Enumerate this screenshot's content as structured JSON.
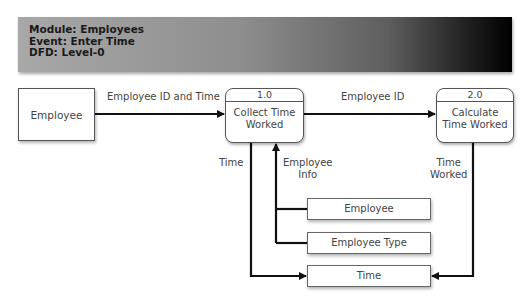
{
  "header": {
    "module": "Module: Employees",
    "event": "Event: Enter Time",
    "dfd": "DFD: Level-0"
  },
  "external_entities": [
    {
      "label": "Employee"
    }
  ],
  "processes": [
    {
      "id": "1.0",
      "name_line1": "Collect Time",
      "name_line2": "Worked"
    },
    {
      "id": "2.0",
      "name_line1": "Calculate",
      "name_line2": "Time Worked"
    }
  ],
  "data_stores": [
    {
      "label": "Employee"
    },
    {
      "label": "Employee Type"
    },
    {
      "label": "Time"
    }
  ],
  "flows": [
    {
      "label": "Employee ID and Time",
      "from": "Employee",
      "to": "1.0"
    },
    {
      "label": "Employee ID",
      "from": "1.0",
      "to": "2.0"
    },
    {
      "label": "Time",
      "from": "1.0",
      "to": "Time store"
    },
    {
      "label_line1": "Employee",
      "label_line2": "Info",
      "from": "Employee / Employee Type stores",
      "to": "1.0"
    },
    {
      "label_line1": "Time",
      "label_line2": "Worked",
      "from": "2.0",
      "to": "Time store"
    }
  ]
}
